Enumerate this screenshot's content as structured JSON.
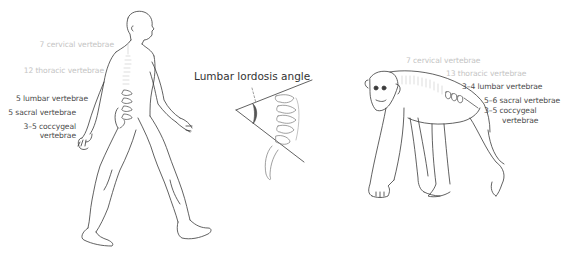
{
  "diagram": {
    "type": "comparative-anatomy",
    "colors": {
      "line": "#3a3a3a",
      "faint_text": "#c4c4c4",
      "dark_text": "#4a4a4a",
      "angle_fill": "#555555",
      "spine_faint": "#cfcfcf"
    }
  },
  "human": {
    "labels": {
      "cervical": "7 cervical vertebrae",
      "thoracic": "12 thoracic vertebrae",
      "lumbar": "5 lumbar vertebrae",
      "sacral": "5 sacral vertebrae",
      "coccygeal_1": "3–5 coccygeal",
      "coccygeal_2": "vertebrae"
    }
  },
  "inset": {
    "title": "Lumbar lordosis angle"
  },
  "chimpanzee": {
    "labels": {
      "cervical": "7 cervical vertebrae",
      "thoracic": "13 thoracic vertebrae",
      "lumbar": "3–4 lumbar vertebrae",
      "sacral": "5–6 sacral vertebrae",
      "coccygeal_1": "3–5 coccygeal",
      "coccygeal_2": "vertebrae"
    }
  }
}
